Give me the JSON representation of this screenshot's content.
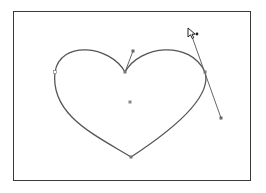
{
  "figure": {
    "tool": "direct-selection-arrow",
    "colors": {
      "frame": "#3a3a3a",
      "path": "#555555",
      "handle": "#666666",
      "anchor": "#777777"
    }
  },
  "path": {
    "anchors": [
      {
        "name": "top-cusp",
        "x": 125,
        "y": 72
      },
      {
        "name": "right",
        "x": 205,
        "y": 72
      },
      {
        "name": "bottom-tip",
        "x": 131,
        "y": 157
      },
      {
        "name": "left",
        "x": 55,
        "y": 72
      }
    ],
    "handles": [
      {
        "from": "top-cusp",
        "x": 133,
        "y": 51
      },
      {
        "from": "right",
        "x": 190,
        "y": 30
      },
      {
        "from": "right",
        "x": 221,
        "y": 118
      }
    ],
    "center_point": {
      "x": 130,
      "y": 102
    }
  },
  "cursor": {
    "x": 189,
    "y": 29,
    "icon": "arrow-pointer-with-plus"
  }
}
